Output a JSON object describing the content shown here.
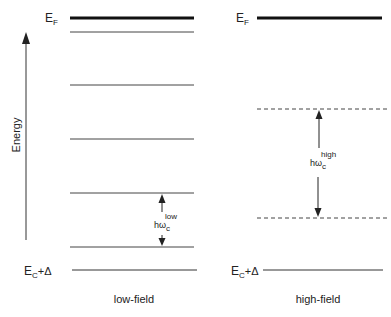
{
  "diagram": {
    "axis_label": "Energy",
    "left_panel": {
      "caption": "low-field",
      "fermi_label_main": "E",
      "fermi_label_sub": "F",
      "bottom_label_main": "E",
      "bottom_label_sub": "C",
      "bottom_label_tail": "+Δ",
      "spacing_label_main": "hω",
      "spacing_label_sub": "c",
      "spacing_label_sup": "low",
      "levels_y": [
        32,
        85,
        139,
        193,
        247
      ]
    },
    "right_panel": {
      "caption": "high-field",
      "fermi_label_main": "E",
      "fermi_label_sub": "F",
      "bottom_label_main": "E",
      "bottom_label_sub": "C",
      "bottom_label_tail": "+Δ",
      "spacing_label_main": "hω",
      "spacing_label_sub": "c",
      "spacing_label_sup": "high",
      "levels_y": [
        109,
        218
      ]
    },
    "colors": {
      "line": "#222222",
      "thin_line": "#444444"
    }
  }
}
